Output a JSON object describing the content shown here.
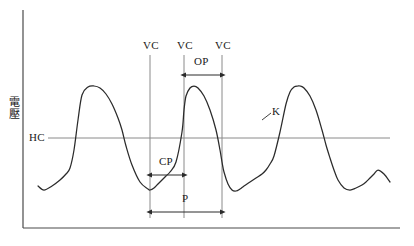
{
  "figure": {
    "axis_label_y": "電壓",
    "line_color": "#2b2b2b",
    "guide_color": "#8a8a8a",
    "axis_color": "#4a4a4a",
    "background": "#ffffff"
  },
  "labels": {
    "vc1": "VC",
    "vc2": "VC",
    "vc3": "VC",
    "hc": "HC",
    "op": "OP",
    "cp": "CP",
    "p": "P",
    "k": "K"
  },
  "chart_data": {
    "type": "line",
    "title": "",
    "xlabel": "",
    "ylabel": "電壓",
    "grid": false,
    "legend": null,
    "xlim": [
      0,
      414
    ],
    "ylim": [
      246,
      0
    ],
    "axis_origin": {
      "x": 23,
      "y": 228
    },
    "axis_x_end": 400,
    "axis_y_top": 10,
    "threshold_line": {
      "name": "HC",
      "y": 138,
      "x_start": 48,
      "x_end": 390
    },
    "vertical_markers": [
      {
        "name": "VC",
        "x": 150,
        "y_top": 55,
        "y_bottom": 218
      },
      {
        "name": "VC",
        "x": 184,
        "y_top": 55,
        "y_bottom": 218
      },
      {
        "name": "VC",
        "x": 222,
        "y_top": 55,
        "y_bottom": 218
      }
    ],
    "measure_arrows": [
      {
        "name": "OP",
        "x_start": 184,
        "x_end": 222,
        "y": 75,
        "label_y": 62
      },
      {
        "name": "CP",
        "x_start": 150,
        "x_end": 184,
        "y": 175,
        "label_y": 162
      },
      {
        "name": "P",
        "x_start": 150,
        "x_end": 222,
        "y": 212,
        "label_y": 198
      }
    ],
    "annotation": {
      "name": "K",
      "label_x": 274,
      "label_y": 112,
      "pointer_from": [
        262,
        122
      ],
      "pointer_to": [
        270,
        114
      ]
    },
    "series": [
      {
        "name": "oscillation-waveform",
        "x": [
          38,
          44,
          52,
          60,
          66,
          70,
          74,
          78,
          82,
          88,
          94,
          100,
          106,
          112,
          118,
          122,
          126,
          132,
          140,
          148,
          150,
          154,
          158,
          162,
          166,
          170,
          176,
          182,
          184,
          186,
          190,
          194,
          198,
          204,
          210,
          216,
          220,
          222,
          224,
          228,
          232,
          236,
          240,
          244,
          250,
          256,
          262,
          266,
          270,
          274,
          280,
          286,
          290,
          294,
          298,
          300,
          304,
          310,
          316,
          322,
          326,
          330,
          334,
          338,
          344,
          350,
          356,
          362,
          366,
          370,
          374,
          378,
          384,
          390
        ],
        "y": [
          186,
          190,
          186,
          180,
          174,
          168,
          150,
          120,
          95,
          87,
          86,
          88,
          94,
          104,
          118,
          130,
          146,
          165,
          182,
          189,
          190,
          188,
          184,
          180,
          176,
          172,
          162,
          132,
          110,
          96,
          88,
          86,
          88,
          96,
          110,
          130,
          150,
          162,
          172,
          184,
          190,
          191,
          189,
          186,
          182,
          178,
          174,
          170,
          164,
          156,
          132,
          104,
          92,
          87,
          86,
          86,
          88,
          96,
          110,
          130,
          145,
          158,
          170,
          180,
          188,
          190,
          188,
          185,
          182,
          178,
          174,
          170,
          174,
          182
        ],
        "description": "relaxation-oscillator voltage waveform with fast rise, rounded crest and slow decay"
      }
    ]
  }
}
